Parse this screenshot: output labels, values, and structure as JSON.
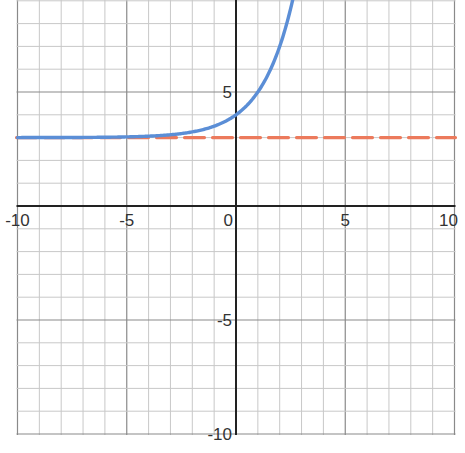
{
  "chart_data": {
    "type": "line",
    "title": "",
    "xlabel": "",
    "ylabel": "",
    "xlim": [
      -10,
      10
    ],
    "ylim": [
      -10,
      9
    ],
    "grid": true,
    "grid_minor_step": 1,
    "grid_major_step": 5,
    "x_ticks": [
      -10,
      -5,
      0,
      5,
      10
    ],
    "y_ticks": [
      5,
      -5,
      -10
    ],
    "x_tick_labels": [
      "-10",
      "-5",
      "0",
      "5",
      "10"
    ],
    "y_tick_labels": [
      "5",
      "-5",
      "-10"
    ],
    "series": [
      {
        "name": "exponential curve",
        "style": "solid",
        "color": "#5b8ed6",
        "formula": "y = 2^x + 3",
        "x": [
          -10,
          -8,
          -6,
          -4,
          -3,
          -2,
          -1,
          0,
          1,
          2,
          2.6
        ],
        "values": [
          3.001,
          3.004,
          3.016,
          3.06,
          3.13,
          3.25,
          3.5,
          4,
          5,
          7,
          9.06
        ]
      },
      {
        "name": "horizontal asymptote",
        "style": "dashed",
        "color": "#ec7a5c",
        "formula": "y = 3",
        "x": [
          -10,
          10
        ],
        "values": [
          3,
          3
        ]
      }
    ]
  },
  "colors": {
    "curve": "#5b8ed6",
    "asymptote": "#ec7a5c",
    "axis": "#222222",
    "grid_minor": "#c8c8c8",
    "grid_major": "#8a8a8a"
  }
}
